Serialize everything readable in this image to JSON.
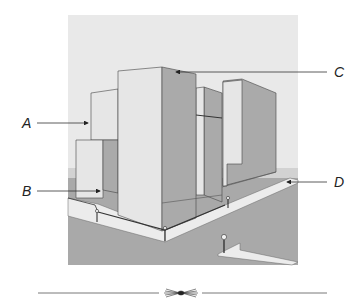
{
  "figure": {
    "labels": [
      {
        "id": "A",
        "text": "A"
      },
      {
        "id": "B",
        "text": "B"
      },
      {
        "id": "C",
        "text": "C"
      },
      {
        "id": "D",
        "text": "D"
      }
    ],
    "colors": {
      "sky": "#e9e9e9",
      "ground": "#a9a9a9",
      "front_face": "#e6e6e6",
      "side_face": "#aaaaaa",
      "sidewalk": "#ececec",
      "outline": "#444444",
      "text": "#222222"
    }
  }
}
